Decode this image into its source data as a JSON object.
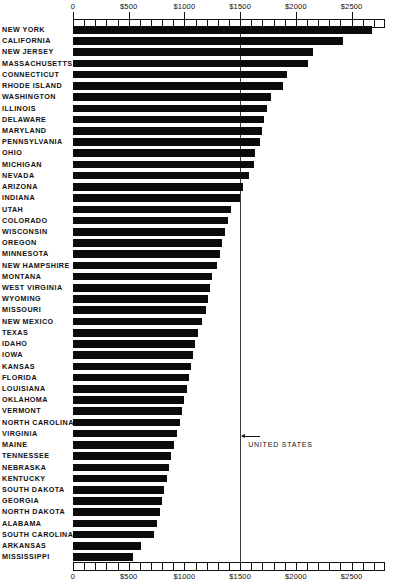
{
  "chart_data": {
    "type": "bar",
    "orientation": "horizontal",
    "title": "",
    "xlabel": "",
    "ylabel": "",
    "xlim": [
      0,
      2800
    ],
    "grid": false,
    "legend": null,
    "axis_tick_labels": [
      "0",
      "$500",
      "$1000",
      "$1500",
      "$2000",
      "$2500"
    ],
    "axis_tick_values": [
      0,
      500,
      1000,
      1500,
      2000,
      2500
    ],
    "minor_tick_step": 100,
    "reference_line": {
      "label": "UNITED STATES",
      "value": 1500
    },
    "categories": [
      "NEW YORK",
      "CALIFORNIA",
      "NEW JERSEY",
      "MASSACHUSETTS",
      "CONNECTICUT",
      "RHODE ISLAND",
      "WASHINGTON",
      "ILLINOIS",
      "DELAWARE",
      "MARYLAND",
      "PENNSYLVANIA",
      "OHIO",
      "MICHIGAN",
      "NEVADA",
      "ARIZONA",
      "INDIANA",
      "UTAH",
      "COLORADO",
      "WISCONSIN",
      "OREGON",
      "MINNESOTA",
      "NEW HAMPSHIRE",
      "MONTANA",
      "WEST VIRGINIA",
      "WYOMING",
      "MISSOURI",
      "NEW MEXICO",
      "TEXAS",
      "IDAHO",
      "IOWA",
      "KANSAS",
      "FLORIDA",
      "LOUISIANA",
      "OKLAHOMA",
      "VERMONT",
      "NORTH CAROLINA",
      "VIRGINIA",
      "MAINE",
      "TENNESSEE",
      "NEBRASKA",
      "KENTUCKY",
      "SOUTH DAKOTA",
      "GEORGIA",
      "NORTH DAKOTA",
      "ALABAMA",
      "SOUTH CAROLINA",
      "ARKANSAS",
      "MISSISSIPPI"
    ],
    "values": [
      2680,
      2420,
      2155,
      2105,
      1920,
      1885,
      1775,
      1740,
      1710,
      1700,
      1680,
      1635,
      1625,
      1580,
      1525,
      1495,
      1420,
      1390,
      1360,
      1340,
      1320,
      1290,
      1250,
      1230,
      1215,
      1195,
      1160,
      1120,
      1095,
      1075,
      1060,
      1045,
      1020,
      1000,
      980,
      960,
      935,
      905,
      880,
      860,
      840,
      820,
      800,
      780,
      755,
      730,
      610,
      535
    ]
  }
}
